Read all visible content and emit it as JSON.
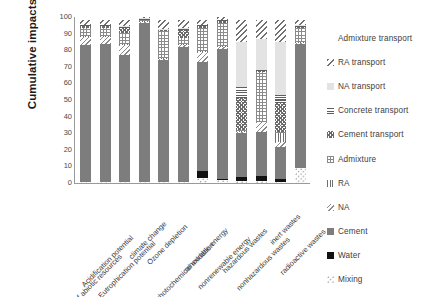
{
  "chart_data": {
    "type": "bar",
    "subtype": "stacked-bar-100-percent",
    "title": "",
    "xlabel": "",
    "ylabel": "Cumulative impacts",
    "ylim": [
      0,
      100
    ],
    "yticks": [
      0,
      10,
      20,
      30,
      40,
      50,
      60,
      70,
      80,
      90,
      100
    ],
    "grid": false,
    "legend_position": "right",
    "categories": [
      "depletion of abiotic resources",
      "Acidification potential",
      "Eutrophication potential",
      "climate change",
      "Ozone depletion",
      "photochemical oxidation",
      "renewable energy",
      "nonrenewable energy",
      "hazardous wastes",
      "nonhazardous wastes",
      "inert wastes",
      "radioactive wastes"
    ],
    "series": [
      {
        "name": "Mixing",
        "values": [
          0.4,
          0.4,
          0.4,
          0.4,
          0.4,
          0.4,
          3.0,
          2.0,
          1.5,
          1.5,
          0.8,
          9.0
        ]
      },
      {
        "name": "Water",
        "values": [
          0.3,
          0.3,
          0.3,
          0.3,
          0.3,
          0.3,
          4.5,
          0.5,
          2.0,
          2.5,
          1.8,
          0.3
        ]
      },
      {
        "name": "Cement",
        "values": [
          82.3,
          83.3,
          76.3,
          96.3,
          73.3,
          81.3,
          65.5,
          78.5,
          26.5,
          27.0,
          19.4,
          74.7
        ]
      },
      {
        "name": "NA",
        "values": [
          5.0,
          4.0,
          6.0,
          0.5,
          1.0,
          1.0,
          6.0,
          1.0,
          1.0,
          5.5,
          3.0,
          1.0
        ]
      },
      {
        "name": "RA",
        "values": [
          0.5,
          0.5,
          0.5,
          0.5,
          0.5,
          0.5,
          0.5,
          0.5,
          0.5,
          0.5,
          5.0,
          0.5
        ]
      },
      {
        "name": "Admixture",
        "values": [
          5.0,
          5.0,
          7.0,
          0.5,
          16.0,
          4.0,
          14.0,
          14.0,
          0.5,
          30.0,
          1.0,
          8.5
        ]
      },
      {
        "name": "Cement transport",
        "values": [
          1.0,
          1.0,
          3.0,
          0.5,
          0.5,
          5.0,
          1.0,
          1.0,
          19.0,
          0.5,
          17.0,
          0.5
        ]
      },
      {
        "name": "Concrete transport",
        "values": [
          0.5,
          0.5,
          0.5,
          0.5,
          0.5,
          0.5,
          0.5,
          0.5,
          7.0,
          0.5,
          5.0,
          0.5
        ]
      },
      {
        "name": "NA transport",
        "values": [
          0.5,
          0.5,
          0.5,
          0.5,
          0.5,
          0.5,
          0.5,
          0.5,
          27.0,
          19.0,
          32.0,
          0.5
        ]
      },
      {
        "name": "RA transport",
        "values": [
          2.5,
          2.5,
          3.5,
          0.5,
          5.0,
          4.5,
          2.5,
          1.5,
          13.0,
          11.0,
          13.0,
          3.0
        ]
      },
      {
        "name": "Admixture transport",
        "values": [
          2.0,
          2.0,
          2.0,
          0.0,
          2.0,
          2.0,
          2.0,
          0.0,
          2.0,
          2.0,
          2.0,
          2.0
        ]
      }
    ]
  },
  "legend": {
    "items": [
      {
        "label": "Admixture transport",
        "key": "admixture-transport"
      },
      {
        "label": "RA transport",
        "key": "ra-transport"
      },
      {
        "label": "NA transport",
        "key": "na-transport"
      },
      {
        "label": "Concrete transport",
        "key": "concrete-transport"
      },
      {
        "label": "Cement transport",
        "key": "cement-transport"
      },
      {
        "label": "Admixture",
        "key": "admixture"
      },
      {
        "label": "RA",
        "key": "ra"
      },
      {
        "label": "NA",
        "key": "na"
      },
      {
        "label": "Cement",
        "key": "cement"
      },
      {
        "label": "Water",
        "key": "water"
      },
      {
        "label": "Mixing",
        "key": "mixing"
      }
    ]
  },
  "colors": {
    "cement": "#7d7d7d",
    "water": "#111111",
    "na_transport": "#e3e3e3",
    "axis": "#9a9a9a",
    "text": "#3d3d3d"
  }
}
